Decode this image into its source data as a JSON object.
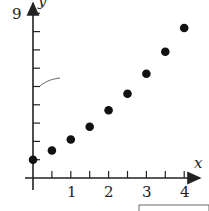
{
  "chart_data": {
    "type": "scatter",
    "title": "",
    "xlabel": "x",
    "ylabel": "y",
    "x_ticks": [
      1,
      2,
      3,
      4
    ],
    "y_ticks_labeled": [
      9
    ],
    "xlim": [
      0,
      4.3
    ],
    "ylim": [
      0,
      9.6
    ],
    "grid": false,
    "x": [
      0,
      0.5,
      1,
      1.5,
      2,
      2.5,
      3,
      3.5,
      4
    ],
    "values": [
      1.0,
      1.5,
      2.1,
      2.8,
      3.7,
      4.6,
      5.7,
      6.9,
      8.2
    ],
    "marker_color": "#111111"
  },
  "labels": {
    "x_axis": "x",
    "y_axis": "y",
    "y_max": "9",
    "x1": "1",
    "x2": "2",
    "x3": "3",
    "x4": "4"
  }
}
